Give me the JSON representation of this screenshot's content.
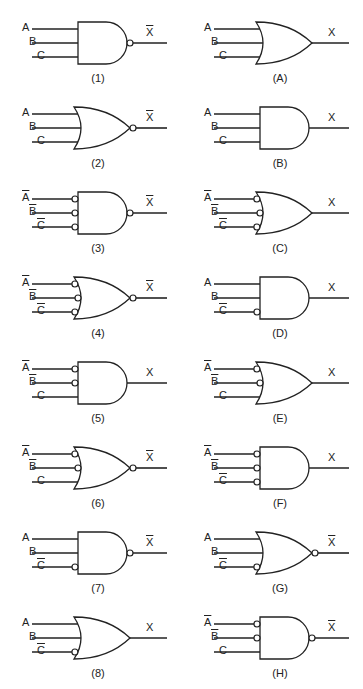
{
  "colors": {
    "stroke": "#222222",
    "background": "#ffffff"
  },
  "gates": [
    {
      "id": "1",
      "caption": "(1)",
      "type": "AND",
      "inputs": [
        {
          "name": "A",
          "inv": false,
          "bubble": false
        },
        {
          "name": "B",
          "inv": false,
          "bubble": false
        },
        {
          "name": "C",
          "inv": false,
          "bubble": false
        }
      ],
      "output": {
        "name": "X",
        "inv": true,
        "bubble": true
      }
    },
    {
      "id": "A",
      "caption": "(A)",
      "type": "OR",
      "inputs": [
        {
          "name": "A",
          "inv": false,
          "bubble": false
        },
        {
          "name": "B",
          "inv": false,
          "bubble": false
        },
        {
          "name": "C",
          "inv": false,
          "bubble": false
        }
      ],
      "output": {
        "name": "X",
        "inv": false,
        "bubble": false
      }
    },
    {
      "id": "2",
      "caption": "(2)",
      "type": "OR",
      "inputs": [
        {
          "name": "A",
          "inv": false,
          "bubble": false
        },
        {
          "name": "B",
          "inv": false,
          "bubble": false
        },
        {
          "name": "C",
          "inv": false,
          "bubble": false
        }
      ],
      "output": {
        "name": "X",
        "inv": true,
        "bubble": true
      }
    },
    {
      "id": "B",
      "caption": "(B)",
      "type": "AND",
      "inputs": [
        {
          "name": "A",
          "inv": false,
          "bubble": false
        },
        {
          "name": "B",
          "inv": false,
          "bubble": false
        },
        {
          "name": "C",
          "inv": false,
          "bubble": false
        }
      ],
      "output": {
        "name": "X",
        "inv": false,
        "bubble": false
      }
    },
    {
      "id": "3",
      "caption": "(3)",
      "type": "AND",
      "inputs": [
        {
          "name": "A",
          "inv": true,
          "bubble": true
        },
        {
          "name": "B",
          "inv": true,
          "bubble": true
        },
        {
          "name": "C",
          "inv": true,
          "bubble": true
        }
      ],
      "output": {
        "name": "X",
        "inv": true,
        "bubble": true
      }
    },
    {
      "id": "C",
      "caption": "(C)",
      "type": "OR",
      "inputs": [
        {
          "name": "A",
          "inv": true,
          "bubble": true
        },
        {
          "name": "B",
          "inv": true,
          "bubble": true
        },
        {
          "name": "C",
          "inv": true,
          "bubble": true
        }
      ],
      "output": {
        "name": "X",
        "inv": false,
        "bubble": false
      }
    },
    {
      "id": "4",
      "caption": "(4)",
      "type": "OR",
      "inputs": [
        {
          "name": "A",
          "inv": true,
          "bubble": true
        },
        {
          "name": "B",
          "inv": true,
          "bubble": true
        },
        {
          "name": "C",
          "inv": true,
          "bubble": true
        }
      ],
      "output": {
        "name": "X",
        "inv": true,
        "bubble": true
      }
    },
    {
      "id": "D",
      "caption": "(D)",
      "type": "AND",
      "inputs": [
        {
          "name": "A",
          "inv": false,
          "bubble": false
        },
        {
          "name": "B",
          "inv": false,
          "bubble": false
        },
        {
          "name": "C",
          "inv": true,
          "bubble": true
        }
      ],
      "output": {
        "name": "X",
        "inv": false,
        "bubble": false
      }
    },
    {
      "id": "5",
      "caption": "(5)",
      "type": "AND",
      "inputs": [
        {
          "name": "A",
          "inv": true,
          "bubble": true
        },
        {
          "name": "B",
          "inv": true,
          "bubble": true
        },
        {
          "name": "C",
          "inv": false,
          "bubble": false
        }
      ],
      "output": {
        "name": "X",
        "inv": false,
        "bubble": false
      }
    },
    {
      "id": "E",
      "caption": "(E)",
      "type": "OR",
      "inputs": [
        {
          "name": "A",
          "inv": true,
          "bubble": true
        },
        {
          "name": "B",
          "inv": true,
          "bubble": true
        },
        {
          "name": "C",
          "inv": false,
          "bubble": false
        }
      ],
      "output": {
        "name": "X",
        "inv": false,
        "bubble": false
      }
    },
    {
      "id": "6",
      "caption": "(6)",
      "type": "OR",
      "inputs": [
        {
          "name": "A",
          "inv": true,
          "bubble": true
        },
        {
          "name": "B",
          "inv": true,
          "bubble": true
        },
        {
          "name": "C",
          "inv": false,
          "bubble": false
        }
      ],
      "output": {
        "name": "X",
        "inv": true,
        "bubble": true
      }
    },
    {
      "id": "F",
      "caption": "(F)",
      "type": "AND",
      "inputs": [
        {
          "name": "A",
          "inv": true,
          "bubble": true
        },
        {
          "name": "B",
          "inv": true,
          "bubble": true
        },
        {
          "name": "C",
          "inv": true,
          "bubble": true
        }
      ],
      "output": {
        "name": "X",
        "inv": false,
        "bubble": false
      }
    },
    {
      "id": "7",
      "caption": "(7)",
      "type": "AND",
      "inputs": [
        {
          "name": "A",
          "inv": false,
          "bubble": false
        },
        {
          "name": "B",
          "inv": false,
          "bubble": false
        },
        {
          "name": "C",
          "inv": true,
          "bubble": true
        }
      ],
      "output": {
        "name": "X",
        "inv": true,
        "bubble": true
      }
    },
    {
      "id": "G",
      "caption": "(G)",
      "type": "OR",
      "inputs": [
        {
          "name": "A",
          "inv": false,
          "bubble": false
        },
        {
          "name": "B",
          "inv": false,
          "bubble": false
        },
        {
          "name": "C",
          "inv": true,
          "bubble": true
        }
      ],
      "output": {
        "name": "X",
        "inv": true,
        "bubble": true
      }
    },
    {
      "id": "8",
      "caption": "(8)",
      "type": "OR",
      "inputs": [
        {
          "name": "A",
          "inv": false,
          "bubble": false
        },
        {
          "name": "B",
          "inv": false,
          "bubble": false
        },
        {
          "name": "C",
          "inv": true,
          "bubble": true
        }
      ],
      "output": {
        "name": "X",
        "inv": false,
        "bubble": false
      }
    },
    {
      "id": "H",
      "caption": "(H)",
      "type": "AND",
      "inputs": [
        {
          "name": "A",
          "inv": true,
          "bubble": true
        },
        {
          "name": "B",
          "inv": true,
          "bubble": true
        },
        {
          "name": "C",
          "inv": false,
          "bubble": false
        }
      ],
      "output": {
        "name": "X",
        "inv": true,
        "bubble": true
      }
    }
  ]
}
